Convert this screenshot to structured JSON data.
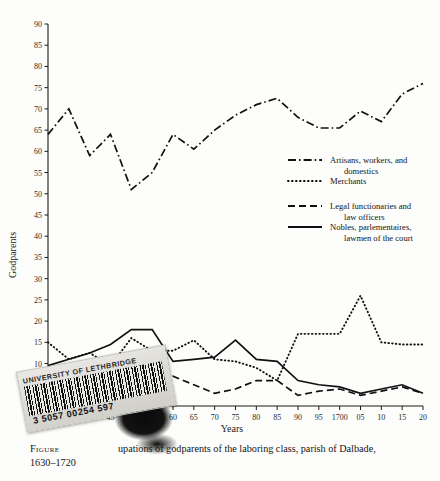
{
  "figure": {
    "caption_prefix": "Figure",
    "caption_text": "upations of godparents of the laboring class, parish of Dalbade,",
    "caption_line2": "1630–1720"
  },
  "sticker": {
    "library": "UNIVERSITY OF LETHBRIDGE",
    "barcode_number": "3 5057 00254 597"
  },
  "chart_data": {
    "type": "line",
    "title": "",
    "xlabel": "Years",
    "ylabel": "Godparents",
    "xlim": [
      1630,
      1720
    ],
    "ylim": [
      0,
      90
    ],
    "grid": false,
    "legend_position": "center-right",
    "x": [
      1630,
      1635,
      1640,
      1645,
      1650,
      1655,
      1660,
      1665,
      1670,
      1675,
      1680,
      1685,
      1690,
      1695,
      1700,
      1705,
      1710,
      1715,
      1720
    ],
    "xtick_labels": [
      "1630",
      "35",
      "40",
      "45",
      "50",
      "55",
      "60",
      "65",
      "70",
      "75",
      "80",
      "85",
      "90",
      "95",
      "1700",
      "05",
      "10",
      "15",
      "20"
    ],
    "ytick_labels": [
      "0",
      "5",
      "10",
      "15",
      "20",
      "25",
      "30",
      "35",
      "40",
      "45",
      "50",
      "55",
      "60",
      "65",
      "70",
      "75",
      "80",
      "85",
      "90"
    ],
    "series": [
      {
        "name": "Artisans, workers, and domestics",
        "style": "dash-dot",
        "color": "#111111",
        "values": [
          64,
          70,
          59,
          64,
          51,
          55,
          64,
          60.5,
          65,
          68.5,
          71,
          72.5,
          68,
          65.5,
          65.5,
          69.5,
          67,
          73.5,
          76
        ]
      },
      {
        "name": "Merchants",
        "style": "dotted",
        "color": "#111111",
        "values": [
          15,
          11,
          12.5,
          9.5,
          16,
          13,
          13,
          15.5,
          11,
          10.5,
          9,
          6,
          17,
          17,
          17,
          26,
          15,
          14.5,
          14.5
        ]
      },
      {
        "name": "Legal functionaries and law officers",
        "style": "dashed",
        "color": "#111111",
        "values": [
          7,
          5,
          7,
          10,
          9.5,
          4.5,
          7,
          5,
          3,
          4,
          6,
          6,
          2.5,
          3.5,
          4,
          2.5,
          3.5,
          4.5,
          3
        ]
      },
      {
        "name": "Nobles, parlementaires, lawmen of the court",
        "style": "solid",
        "color": "#111111",
        "values": [
          9.5,
          11,
          12.5,
          14.5,
          18,
          18,
          10.5,
          11,
          11.5,
          15.5,
          11,
          10.5,
          6,
          5,
          4.5,
          3,
          4,
          5,
          3
        ]
      }
    ],
    "legend": [
      {
        "label_line1": "Artisans, workers, and",
        "label_line2": "domestics",
        "style": "dash-dot"
      },
      {
        "label_line1": "Merchants",
        "label_line2": "",
        "style": "dotted"
      },
      {
        "label_line1": "Legal functionaries and",
        "label_line2": "law officers",
        "style": "dashed"
      },
      {
        "label_line1": "Nobles, parlementaires,",
        "label_line2": "lawmen of the court",
        "style": "solid"
      }
    ]
  }
}
